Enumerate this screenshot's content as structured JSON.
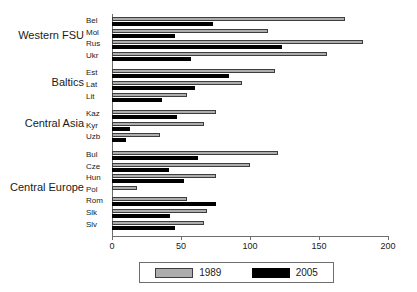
{
  "chart_data": {
    "type": "bar",
    "orientation": "horizontal",
    "title": "",
    "xlabel": "",
    "ylabel": "",
    "xlim": [
      0,
      200
    ],
    "xticks": [
      0,
      50,
      100,
      150,
      200
    ],
    "grid": false,
    "legend_position": "bottom",
    "legend": [
      "1989",
      "2005"
    ],
    "categories": [
      "Bel",
      "Mol",
      "Rus",
      "Ukr",
      "Est",
      "Lat",
      "Lit",
      "Kaz",
      "Kyr",
      "Uzb",
      "Bul",
      "Cze",
      "Hun",
      "Pol",
      "Rom",
      "Slk",
      "Slv"
    ],
    "series": [
      {
        "name": "1989",
        "color": "#adadad",
        "values": [
          169,
          113,
          182,
          156,
          118,
          94,
          54,
          75,
          67,
          35,
          120,
          100,
          75,
          18,
          54,
          69,
          67
        ]
      },
      {
        "name": "2005",
        "color": "#000000",
        "values": [
          73,
          46,
          123,
          57,
          85,
          60,
          36,
          47,
          13,
          10,
          62,
          41,
          52,
          0,
          75,
          42,
          46
        ]
      }
    ],
    "groups": [
      {
        "label": "Western FSU",
        "members": [
          "Bel",
          "Mol",
          "Rus",
          "Ukr"
        ]
      },
      {
        "label": "Baltics",
        "members": [
          "Est",
          "Lat",
          "Lit"
        ]
      },
      {
        "label": "Central Asia",
        "members": [
          "Kaz",
          "Kyr",
          "Uzb"
        ]
      },
      {
        "label": "Central Europe",
        "members": [
          "Bul",
          "Cze",
          "Hun",
          "Pol",
          "Rom",
          "Slk",
          "Slv"
        ]
      }
    ]
  },
  "axis": {
    "tick_labels": [
      "0",
      "50",
      "100",
      "150",
      "200"
    ]
  },
  "legend": {
    "entries": [
      {
        "label": "1989",
        "swatch": "gray-swatch"
      },
      {
        "label": "2005",
        "swatch": "black-swatch"
      }
    ]
  }
}
